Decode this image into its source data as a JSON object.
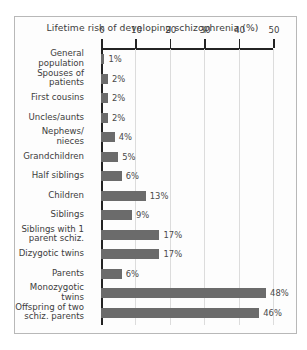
{
  "chart_data": {
    "type": "bar",
    "orientation": "horizontal",
    "title": "Lifetime risk of  developing schizophrenia (%)",
    "xlabel": "",
    "ylabel": "",
    "xlim": [
      0,
      50
    ],
    "xticks": [
      0,
      10,
      20,
      30,
      40,
      50
    ],
    "xtick_labels": [
      "0",
      "10",
      "20",
      "30",
      "40",
      "50"
    ],
    "grid": true,
    "grid_axis": "x",
    "legend": false,
    "bar_color": "#6b6b6b",
    "categories": [
      "General\npopulation",
      "Spouses of\npatients",
      "First cousins",
      "Uncles/aunts",
      "Nephews/\nnieces",
      "Grandchildren",
      "Half siblings",
      "Children",
      "Siblings",
      "Siblings with 1\nparent schiz.",
      "Dizygotic twins",
      "Parents",
      "Monozygotic\ntwins",
      "Offspring of two\nschiz. parents"
    ],
    "values": [
      1,
      2,
      2,
      2,
      4,
      5,
      6,
      13,
      9,
      17,
      17,
      6,
      48,
      46
    ],
    "value_labels": [
      "1%",
      "2%",
      "2%",
      "2%",
      "4%",
      "5%",
      "6%",
      "13%",
      "9%",
      "17%",
      "17%",
      "6%",
      "48%",
      "46%"
    ]
  }
}
